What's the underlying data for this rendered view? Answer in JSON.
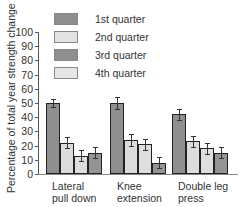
{
  "chart_data": {
    "type": "bar",
    "title": "",
    "xlabel": "",
    "ylabel": "Percentage of total year strength change",
    "ylim": [
      0,
      100
    ],
    "yticks": [
      0,
      10,
      20,
      30,
      40,
      50,
      60,
      70,
      80,
      90,
      100
    ],
    "grid": false,
    "legend_position": "top",
    "categories": [
      "Lateral\npull down",
      "Knee\nextension",
      "Double leg\npress"
    ],
    "series": [
      {
        "name": "1st quarter",
        "values": [
          50,
          50,
          42
        ],
        "errors": [
          3,
          4,
          4
        ],
        "color": "#8f8f8f"
      },
      {
        "name": "2nd quarter",
        "values": [
          22,
          24,
          23
        ],
        "errors": [
          4,
          4,
          4
        ],
        "color": "#dcdcdc"
      },
      {
        "name": "3rd quarter",
        "values": [
          13,
          21,
          18
        ],
        "errors": [
          4,
          4,
          4
        ],
        "color": "#dedede"
      },
      {
        "name": "4th quarter",
        "values": [
          15,
          8,
          15
        ],
        "errors": [
          4,
          4,
          4
        ],
        "color": "#949494"
      }
    ]
  },
  "legend": {
    "items": [
      {
        "label": "1st quarter",
        "color": "#8f8f8f"
      },
      {
        "label": "2nd quarter",
        "color": "#e3e3e3"
      },
      {
        "label": "3rd quarter",
        "color": "#8f8f8f"
      },
      {
        "label": "4th quarter",
        "color": "#e6e6e6"
      }
    ]
  }
}
